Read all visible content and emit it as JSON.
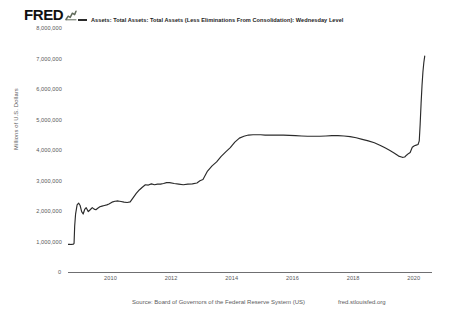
{
  "brand": {
    "wordmark": "FRED",
    "logo_icon": "fred-line-chart-icon"
  },
  "legend": {
    "swatch_color": "#2b2b2b",
    "label": "Assets: Total Assets: Total Assets (Less Eliminations From Consolidation): Wednesday Level"
  },
  "footer": {
    "source": "Source: Board of Governors of the Federal Reserve System (US)",
    "url": "fred.stlouisfed.org"
  },
  "chart_data": {
    "type": "line",
    "title": "",
    "subtitle": "",
    "xlabel": "",
    "ylabel": "Millions of U.S. Dollars",
    "legend_position": "top",
    "grid": false,
    "line_color": "#2b2b2b",
    "ylim": [
      0,
      8000000
    ],
    "xlim": [
      2008.6,
      2020.6
    ],
    "ytick_labels": [
      "8,000,000",
      "7,000,000",
      "6,000,000",
      "5,000,000",
      "4,000,000",
      "3,000,000",
      "2,000,000",
      "1,000,000",
      "0"
    ],
    "ytick_values": [
      8000000,
      7000000,
      6000000,
      5000000,
      4000000,
      3000000,
      2000000,
      1000000,
      0
    ],
    "xtick_labels": [
      "2010",
      "2012",
      "2014",
      "2016",
      "2018",
      "2020"
    ],
    "xtick_values": [
      2010,
      2012,
      2014,
      2016,
      2018,
      2020
    ],
    "series": [
      {
        "name": "Assets: Total Assets: Total Assets (Less Eliminations From Consolidation): Wednesday Level",
        "x": [
          2008.6,
          2008.66,
          2008.7,
          2008.73,
          2008.76,
          2008.78,
          2008.8,
          2008.82,
          2008.85,
          2008.9,
          2008.95,
          2009.0,
          2009.05,
          2009.1,
          2009.15,
          2009.2,
          2009.27,
          2009.34,
          2009.4,
          2009.46,
          2009.52,
          2009.58,
          2009.65,
          2009.72,
          2009.8,
          2009.88,
          2009.95,
          2010.05,
          2010.15,
          2010.25,
          2010.35,
          2010.45,
          2010.55,
          2010.65,
          2010.75,
          2010.85,
          2010.95,
          2011.05,
          2011.15,
          2011.25,
          2011.35,
          2011.45,
          2011.55,
          2011.65,
          2011.75,
          2011.85,
          2011.95,
          2012.1,
          2012.25,
          2012.4,
          2012.55,
          2012.7,
          2012.85,
          2012.95,
          2013.05,
          2013.2,
          2013.35,
          2013.5,
          2013.65,
          2013.8,
          2013.95,
          2014.1,
          2014.25,
          2014.4,
          2014.55,
          2014.7,
          2014.85,
          2014.95,
          2015.1,
          2015.3,
          2015.5,
          2015.7,
          2015.9,
          2016.1,
          2016.3,
          2016.5,
          2016.7,
          2016.9,
          2017.1,
          2017.3,
          2017.5,
          2017.7,
          2017.9,
          2018.1,
          2018.3,
          2018.5,
          2018.7,
          2018.9,
          2019.05,
          2019.2,
          2019.35,
          2019.5,
          2019.62,
          2019.7,
          2019.76,
          2019.82,
          2019.88,
          2019.95,
          2020.02,
          2020.08,
          2020.14,
          2020.18,
          2020.21,
          2020.24,
          2020.27,
          2020.3,
          2020.33,
          2020.36
        ],
        "y": [
          905000,
          905000,
          900000,
          905000,
          910000,
          915000,
          940000,
          1500000,
          1900000,
          2200000,
          2260000,
          2180000,
          1980000,
          1900000,
          2050000,
          2110000,
          1980000,
          2050000,
          2110000,
          2060000,
          2040000,
          2090000,
          2140000,
          2160000,
          2180000,
          2200000,
          2230000,
          2290000,
          2320000,
          2330000,
          2310000,
          2290000,
          2280000,
          2300000,
          2440000,
          2580000,
          2690000,
          2780000,
          2860000,
          2850000,
          2890000,
          2860000,
          2880000,
          2880000,
          2900000,
          2930000,
          2930000,
          2900000,
          2880000,
          2860000,
          2880000,
          2890000,
          2920000,
          2990000,
          3030000,
          3310000,
          3480000,
          3610000,
          3790000,
          3940000,
          4080000,
          4260000,
          4390000,
          4450000,
          4490000,
          4500000,
          4500000,
          4500000,
          4490000,
          4490000,
          4490000,
          4490000,
          4480000,
          4470000,
          4460000,
          4450000,
          4450000,
          4450000,
          4460000,
          4470000,
          4470000,
          4460000,
          4440000,
          4400000,
          4350000,
          4300000,
          4240000,
          4150000,
          4070000,
          3990000,
          3900000,
          3800000,
          3760000,
          3770000,
          3830000,
          3880000,
          3920000,
          4090000,
          4140000,
          4160000,
          4180000,
          4300000,
          4850000,
          5520000,
          6100000,
          6550000,
          6860000,
          7080000
        ]
      }
    ]
  }
}
